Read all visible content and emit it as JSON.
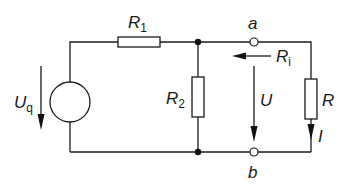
{
  "diagram": {
    "type": "circuit-schematic",
    "labels": {
      "source": {
        "main": "U",
        "sub": "q"
      },
      "r1": {
        "main": "R",
        "sub": "1"
      },
      "r2": {
        "main": "R",
        "sub": "2"
      },
      "terminal_a": "a",
      "terminal_b": "b",
      "internal_resistance": {
        "main": "R",
        "sub": "i"
      },
      "voltage": "U",
      "load": "R",
      "current": "I"
    },
    "components": [
      {
        "id": "Uq",
        "kind": "voltage-source"
      },
      {
        "id": "R1",
        "kind": "resistor",
        "placement": "series, top branch"
      },
      {
        "id": "R2",
        "kind": "resistor",
        "placement": "shunt, parallel to terminals"
      },
      {
        "id": "R",
        "kind": "resistor",
        "placement": "load across a-b"
      }
    ],
    "colors": {
      "line": "#1a1a1a",
      "background": "#ffffff"
    }
  }
}
